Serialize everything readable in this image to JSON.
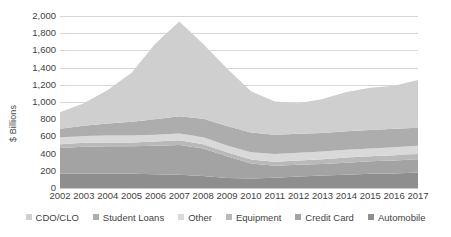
{
  "chart_data": {
    "type": "area",
    "stacked": true,
    "title": "",
    "xlabel": "",
    "ylabel": "$ Billions",
    "ylim": [
      0,
      2000
    ],
    "ytick_step": 200,
    "grid": true,
    "legend_position": "bottom",
    "categories": [
      "2002",
      "2003",
      "2004",
      "2005",
      "2006",
      "2007",
      "2008",
      "2009",
      "2010",
      "2011",
      "2012",
      "2013",
      "2014",
      "2015",
      "2016",
      "2017"
    ],
    "ytick_labels": [
      "2,000",
      "1,800",
      "1,600",
      "1,400",
      "1,200",
      "1,000",
      "800",
      "600",
      "400",
      "200",
      "0"
    ],
    "ytick_values": [
      2000,
      1800,
      1600,
      1400,
      1200,
      1000,
      800,
      600,
      400,
      200,
      0
    ],
    "series": [
      {
        "name": "Automobile",
        "color": "#8e8e8e",
        "values": [
          165,
          170,
          170,
          165,
          160,
          155,
          140,
          115,
          110,
          120,
          135,
          145,
          155,
          165,
          170,
          180
        ]
      },
      {
        "name": "Credit Card",
        "color": "#a3a3a3",
        "values": [
          300,
          310,
          315,
          320,
          330,
          345,
          320,
          255,
          175,
          140,
          135,
          135,
          140,
          145,
          150,
          155
        ]
      },
      {
        "name": "Equipment",
        "color": "#b9b9b9",
        "values": [
          45,
          45,
          45,
          45,
          50,
          55,
          50,
          45,
          45,
          45,
          50,
          55,
          60,
          60,
          60,
          60
        ]
      },
      {
        "name": "Other",
        "color": "#d9d9d9",
        "values": [
          80,
          80,
          80,
          80,
          80,
          80,
          80,
          80,
          85,
          90,
          90,
          90,
          90,
          90,
          95,
          95
        ]
      },
      {
        "name": "Student Loans",
        "color": "#adadad",
        "values": [
          100,
          120,
          140,
          160,
          180,
          200,
          215,
          225,
          230,
          225,
          220,
          215,
          215,
          215,
          215,
          210
        ]
      },
      {
        "name": "CDO/CLO",
        "color": "#cfcfcf",
        "values": [
          190,
          260,
          390,
          570,
          880,
          1100,
          870,
          670,
          480,
          385,
          355,
          395,
          455,
          490,
          500,
          555
        ]
      }
    ],
    "series_order_bottom_to_top": [
      "Automobile",
      "Credit Card",
      "Equipment",
      "Other",
      "Student Loans",
      "CDO/CLO"
    ],
    "stack_totals": [
      880,
      985,
      1140,
      1340,
      1680,
      1935,
      1675,
      1390,
      1125,
      1005,
      985,
      1035,
      1115,
      1165,
      1190,
      1255
    ],
    "legend": [
      {
        "label": "CDO/CLO",
        "color": "#cfcfcf"
      },
      {
        "label": "Student Loans",
        "color": "#adadad"
      },
      {
        "label": "Other",
        "color": "#d9d9d9"
      },
      {
        "label": "Equipment",
        "color": "#b9b9b9"
      },
      {
        "label": "Credit Card",
        "color": "#a3a3a3"
      },
      {
        "label": "Automobile",
        "color": "#8e8e8e"
      }
    ]
  }
}
